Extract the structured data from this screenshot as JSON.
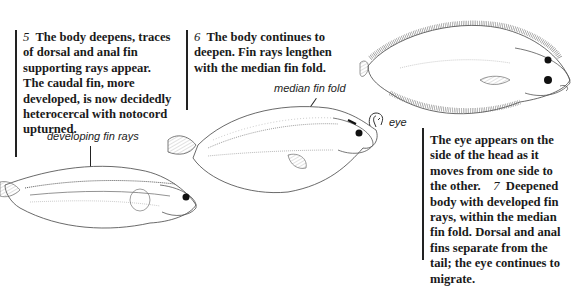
{
  "captions": {
    "stage5": {
      "number": "5",
      "text": "The body deepens, traces of dorsal and anal fin supporting rays appear. The caudal fin, more developed, is now decidedly heterocercal with notocord upturned."
    },
    "stage6": {
      "number": "6",
      "text": "The body continues to deepen. Fin rays lengthen with the median fin fold."
    },
    "stage7": {
      "lead": "The eye appears on the side of the head as it moves from one side to the other.",
      "number": "7",
      "text": "Deepened body with developed fin rays, within the median fin fold. Dorsal and anal fins separate from the tail; the eye continues to migrate."
    }
  },
  "labels": {
    "developing_fin_rays": "developing fin rays",
    "median_fin_fold": "median fin fold",
    "eye": "eye"
  },
  "illustrations": [
    {
      "stage": "5",
      "subject": "larval flatfish with developing fin rays"
    },
    {
      "stage": "6",
      "subject": "larval flatfish with median fin fold"
    },
    {
      "stage": "7",
      "subject": "juvenile flatfish with migrating eye"
    }
  ]
}
